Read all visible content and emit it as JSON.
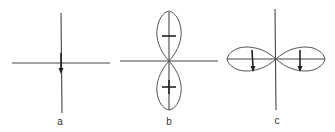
{
  "figure": {
    "colors": {
      "background": "#ffffff",
      "line": "#444444",
      "arrow": "#222222"
    },
    "panels": [
      {
        "id": "a",
        "label": "a",
        "content": "crossed axes with a single downward arrow at the origin"
      },
      {
        "id": "b",
        "label": "b",
        "content": "two vertical lobes; upper lobe marked minus sign, lower lobe marked plus sign"
      },
      {
        "id": "c",
        "label": "c",
        "content": "two horizontal lobes, each with a downward arrow"
      }
    ],
    "signs": {
      "upper": "−",
      "lower": "+"
    }
  }
}
